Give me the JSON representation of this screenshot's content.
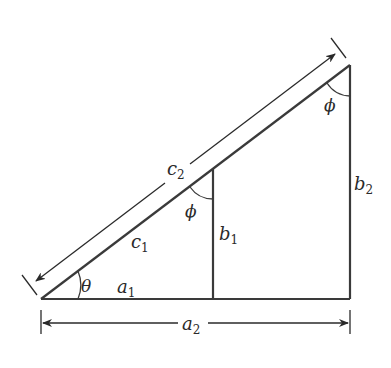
{
  "diagram": {
    "type": "similar right triangles",
    "colors": {
      "stroke": "#3a3a3a",
      "background": "#ffffff"
    },
    "vertices": {
      "origin": [
        41,
        299
      ],
      "apex": [
        350,
        65
      ],
      "right_corner": [
        350,
        299
      ],
      "inner_top": [
        213,
        170
      ],
      "inner_foot": [
        213,
        299
      ]
    },
    "labels": {
      "theta": "θ",
      "phi_inner": "ϕ",
      "phi_outer": "ϕ",
      "a1": {
        "base": "a",
        "sub": "1"
      },
      "a2": {
        "base": "a",
        "sub": "2"
      },
      "b1": {
        "base": "b",
        "sub": "1"
      },
      "b2": {
        "base": "b",
        "sub": "2"
      },
      "c1": {
        "base": "c",
        "sub": "1"
      },
      "c2": {
        "base": "c",
        "sub": "2"
      }
    }
  }
}
